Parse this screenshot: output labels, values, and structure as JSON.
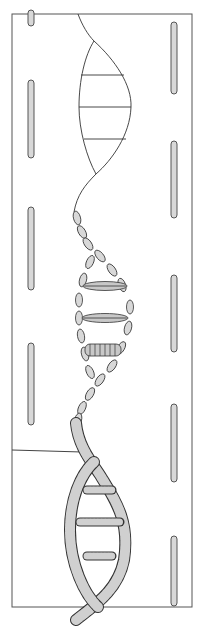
{
  "figure": {
    "colors": {
      "line": "#333333",
      "bead_fill": "#d0d0d0",
      "rod_fill": "#d8d8d8",
      "background": "#ffffff"
    },
    "frame": {
      "x": 12,
      "y": 14,
      "width": 180,
      "height": 593
    },
    "left_rods": [
      {
        "y1": 14,
        "y2": 24
      },
      {
        "y1": 82,
        "y2": 156
      },
      {
        "y1": 208,
        "y2": 288
      },
      {
        "y1": 345,
        "y2": 422
      },
      {
        "y1": 415,
        "y2": 425
      }
    ],
    "right_rods": [
      {
        "y1": 24,
        "y2": 92
      },
      {
        "y1": 143,
        "y2": 217
      },
      {
        "y1": 277,
        "y2": 350
      },
      {
        "y1": 405,
        "y2": 480
      },
      {
        "y1": 538,
        "y2": 605
      }
    ],
    "horizontal_line_y": 450
  }
}
